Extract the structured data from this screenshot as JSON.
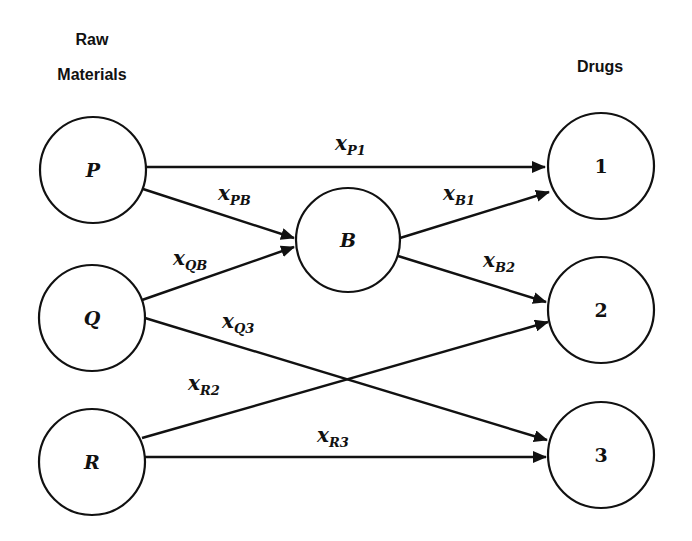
{
  "headers": {
    "left_line1": "Raw",
    "left_line2": "Materials",
    "right": "Drugs"
  },
  "nodes": {
    "P": {
      "label": "P",
      "cx": 93,
      "cy": 170
    },
    "Q": {
      "label": "Q",
      "cx": 92,
      "cy": 318
    },
    "R": {
      "label": "R",
      "cx": 92,
      "cy": 462
    },
    "B": {
      "label": "B",
      "cx": 348,
      "cy": 240
    },
    "D1": {
      "label": "1",
      "cx": 601,
      "cy": 166
    },
    "D2": {
      "label": "2",
      "cx": 601,
      "cy": 310
    },
    "D3": {
      "label": "3",
      "cx": 601,
      "cy": 455
    }
  },
  "edges": [
    {
      "from": "P",
      "to": "1",
      "var": "x",
      "sub": "P1"
    },
    {
      "from": "P",
      "to": "B",
      "var": "x",
      "sub": "PB"
    },
    {
      "from": "Q",
      "to": "B",
      "var": "x",
      "sub": "QB"
    },
    {
      "from": "B",
      "to": "1",
      "var": "x",
      "sub": "B1"
    },
    {
      "from": "B",
      "to": "2",
      "var": "x",
      "sub": "B2"
    },
    {
      "from": "Q",
      "to": "3",
      "var": "x",
      "sub": "Q3"
    },
    {
      "from": "R",
      "to": "2",
      "var": "x",
      "sub": "R2"
    },
    {
      "from": "R",
      "to": "3",
      "var": "x",
      "sub": "R3"
    }
  ]
}
